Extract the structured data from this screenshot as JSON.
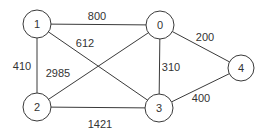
{
  "diagram": {
    "type": "weighted-undirected-graph",
    "nodes": [
      {
        "id": "0",
        "label": "0",
        "x": 160,
        "y": 25,
        "r": 14
      },
      {
        "id": "1",
        "label": "1",
        "x": 37,
        "y": 24,
        "r": 14
      },
      {
        "id": "2",
        "label": "2",
        "x": 37,
        "y": 107,
        "r": 14
      },
      {
        "id": "3",
        "label": "3",
        "x": 159,
        "y": 108,
        "r": 14
      },
      {
        "id": "4",
        "label": "4",
        "x": 241,
        "y": 68,
        "r": 13
      }
    ],
    "edges": [
      {
        "from": "1",
        "to": "0",
        "weight": "800",
        "label_x": 97,
        "label_y": 16
      },
      {
        "from": "1",
        "to": "3",
        "weight": "612",
        "label_x": 85,
        "label_y": 43
      },
      {
        "from": "1",
        "to": "2",
        "weight": "410",
        "label_x": 22,
        "label_y": 66
      },
      {
        "from": "2",
        "to": "0",
        "weight": "2985",
        "label_x": 58,
        "label_y": 73
      },
      {
        "from": "0",
        "to": "3",
        "weight": "310",
        "label_x": 171,
        "label_y": 67
      },
      {
        "from": "0",
        "to": "4",
        "weight": "200",
        "label_x": 205,
        "label_y": 37
      },
      {
        "from": "3",
        "to": "4",
        "weight": "400",
        "label_x": 201,
        "label_y": 98
      },
      {
        "from": "2",
        "to": "3",
        "weight": "1421",
        "label_x": 100,
        "label_y": 124
      }
    ],
    "colors": {
      "stroke": "#3a3a3a",
      "text": "#333333",
      "background": "#ffffff"
    }
  }
}
